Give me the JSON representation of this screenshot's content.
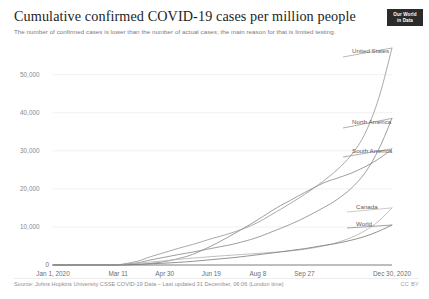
{
  "header": {
    "title": "Cumulative confirmed COVID-19 cases per million people",
    "subtitle": "The number of confirmed cases is lower than the number of actual cases; the main reason for that is limited testing.",
    "logo_line1": "Our World",
    "logo_line2": "in Data"
  },
  "footer": {
    "source": "Source: Johns Hopkins University CSSE COVID-19 Data – Last updated 31 December, 06:06 (London time)",
    "license": "CC BY"
  },
  "chart_data": {
    "type": "line",
    "title": "Cumulative confirmed COVID-19 cases per million people",
    "subtitle": "The number of confirmed cases is lower than the number of actual cases; the main reason for that is limited testing.",
    "xlabel": "",
    "ylabel": "",
    "grid": true,
    "legend_position": "right-inline-labels",
    "ylim": [
      0,
      57000
    ],
    "yticks": [
      0,
      10000,
      20000,
      30000,
      40000,
      50000
    ],
    "ytick_labels": [
      "0",
      "10,000",
      "20,000",
      "30,000",
      "40,000",
      "50,000"
    ],
    "xlim_days": [
      0,
      364
    ],
    "xticks_days": [
      0,
      70,
      120,
      170,
      220,
      270,
      364
    ],
    "xtick_labels": [
      "Jan 1, 2020",
      "Mar 11",
      "Apr 30",
      "Jun 19",
      "Aug 8",
      "Sep 27",
      "Dec 30, 2020"
    ],
    "x": [
      0,
      30,
      60,
      70,
      90,
      105,
      120,
      135,
      150,
      170,
      190,
      205,
      220,
      240,
      255,
      270,
      290,
      305,
      320,
      335,
      350,
      364
    ],
    "series": [
      {
        "name": "United States",
        "color": "#9a9a9a",
        "end_value": 57000,
        "values": [
          0,
          2,
          12,
          60,
          950,
          2200,
          3300,
          4400,
          5400,
          6900,
          8300,
          9600,
          11200,
          14000,
          16200,
          18500,
          22000,
          25000,
          28800,
          34500,
          44000,
          57000
        ]
      },
      {
        "name": "North America",
        "color": "#8d8d8d",
        "end_value": 38500,
        "values": [
          0,
          1,
          7,
          35,
          560,
          1350,
          2050,
          2750,
          3400,
          4350,
          5300,
          6200,
          7300,
          9200,
          10700,
          12400,
          15000,
          17200,
          20100,
          24200,
          30500,
          38500
        ]
      },
      {
        "name": "South America",
        "color": "#8d8d8d",
        "end_value": 30500,
        "values": [
          0,
          0,
          1,
          4,
          120,
          420,
          900,
          1700,
          2800,
          5000,
          7600,
          9700,
          11900,
          15000,
          17000,
          19000,
          21500,
          22800,
          24100,
          25800,
          27900,
          30500
        ]
      },
      {
        "name": "Canada",
        "color": "#b4b4b4",
        "end_value": 15000,
        "values": [
          0,
          0,
          2,
          18,
          380,
          800,
          1100,
          1500,
          1800,
          2200,
          2550,
          2800,
          3050,
          3400,
          3700,
          4100,
          5000,
          5900,
          7200,
          9000,
          11600,
          15000
        ]
      },
      {
        "name": "World",
        "color": "#7d7d7d",
        "end_value": 10500,
        "values": [
          0,
          1,
          12,
          20,
          160,
          310,
          480,
          700,
          960,
          1400,
          1850,
          2250,
          2700,
          3300,
          3800,
          4300,
          5100,
          5700,
          6500,
          7500,
          8900,
          10500
        ]
      }
    ]
  }
}
